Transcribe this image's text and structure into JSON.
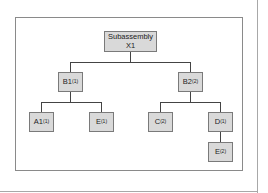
{
  "diagram": {
    "type": "product-structure-tree",
    "root": {
      "line1": "Subassembly",
      "line2": "X1"
    },
    "level1": [
      {
        "name": "B1",
        "qty": "(1)"
      },
      {
        "name": "B2",
        "qty": "(2)"
      }
    ],
    "level2": [
      {
        "name": "A1",
        "qty": "(1)",
        "parent": "B1"
      },
      {
        "name": "E",
        "qty": "(1)",
        "parent": "B1"
      },
      {
        "name": "C",
        "qty": "(2)",
        "parent": "B2"
      },
      {
        "name": "D",
        "qty": "(1)",
        "parent": "B2"
      }
    ],
    "level3": [
      {
        "name": "E",
        "qty": "(2)",
        "parent": "D"
      }
    ],
    "colors": {
      "node_fill": "#d9d9d9",
      "node_border": "#7a7a7a",
      "connector": "#444444",
      "frame": "#8a8a8a"
    }
  }
}
